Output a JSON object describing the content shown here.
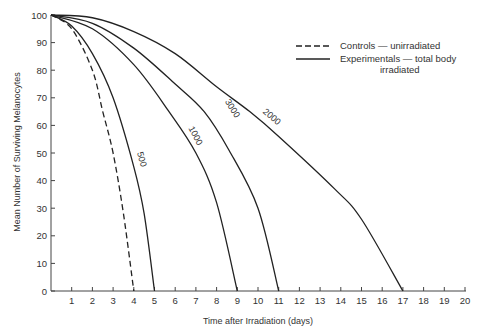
{
  "chart_data": {
    "type": "line",
    "title": "",
    "xlabel": "Time after Irradiation (days)",
    "ylabel": "Mean Number of Surviving Melanocytes",
    "xlim": [
      0,
      20
    ],
    "ylim": [
      0,
      100
    ],
    "x_ticks": [
      1,
      2,
      3,
      4,
      5,
      6,
      7,
      8,
      9,
      10,
      11,
      12,
      13,
      14,
      15,
      16,
      17,
      18,
      19,
      20
    ],
    "y_ticks": [
      0,
      10,
      20,
      30,
      40,
      50,
      60,
      70,
      80,
      90,
      100
    ],
    "grid": false,
    "legend_position": "upper right",
    "legend": [
      {
        "label": "Controls — unirradiated",
        "style": "dashed"
      },
      {
        "label": "Experimentals — total body irradiated",
        "style": "solid"
      }
    ],
    "series": [
      {
        "name": "Controls",
        "label": "",
        "style": "dashed",
        "x": [
          0,
          1,
          2,
          2.5,
          3,
          3.5,
          4
        ],
        "y": [
          100,
          95,
          80,
          65,
          50,
          28,
          0
        ]
      },
      {
        "name": "500",
        "label": "500",
        "style": "solid",
        "x": [
          0,
          1,
          2,
          3,
          4,
          4.5,
          5
        ],
        "y": [
          100,
          96,
          86,
          70,
          45,
          28,
          0
        ]
      },
      {
        "name": "1000",
        "label": "1000",
        "style": "solid",
        "x": [
          0,
          2,
          4,
          5.7,
          7,
          8,
          9
        ],
        "y": [
          100,
          95,
          82,
          65,
          50,
          32,
          0
        ]
      },
      {
        "name": "3000",
        "label": "3000",
        "style": "solid",
        "x": [
          0,
          2,
          4,
          6,
          7.4,
          8.6,
          10,
          11
        ],
        "y": [
          100,
          97,
          88,
          75,
          65,
          51,
          30,
          0
        ]
      },
      {
        "name": "2000",
        "label": "2000",
        "style": "solid",
        "x": [
          0,
          2,
          4,
          6,
          8,
          9.6,
          11,
          13.7,
          15,
          17
        ],
        "y": [
          100,
          99,
          94,
          86,
          74,
          65,
          56,
          37,
          26,
          0
        ]
      }
    ]
  }
}
